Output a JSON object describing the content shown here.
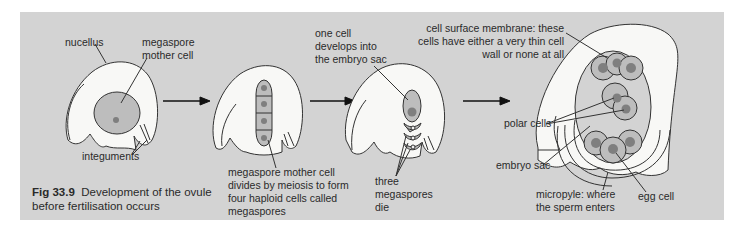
{
  "figure": {
    "number": "Fig 33.9",
    "title_line1": "Development of the ovule",
    "title_line2": "before fertilisation occurs"
  },
  "colors": {
    "background": "#d3d3d3",
    "tissue": "#f8f8f6",
    "cell_fill": "#bdbdbd",
    "nucleus": "#7f7f7f",
    "outline": "#333333"
  },
  "stages": [
    {
      "id": "stage-1",
      "labels": {
        "nucellus": "nucellus",
        "megaspore_l1": "megaspore",
        "megaspore_l2": "mother cell",
        "integuments": "integuments"
      }
    },
    {
      "id": "stage-2",
      "labels": {
        "line1": "megaspore mother cell",
        "line2": "divides by meiosis to form",
        "line3": "four haploid cells called",
        "line4": "megaspores"
      }
    },
    {
      "id": "stage-3",
      "labels": {
        "embryo_l1": "one cell",
        "embryo_l2": "develops into",
        "embryo_l3": "the embryo sac",
        "die_l1": "three",
        "die_l2": "megaspores",
        "die_l3": "die"
      }
    },
    {
      "id": "stage-4",
      "labels": {
        "membrane_l1": "cell surface membrane: these",
        "membrane_l2": "cells have either a very thin cell",
        "membrane_l3": "wall or none at all",
        "polar": "polar cells",
        "embryo_sac": "embryo sac",
        "micropyle_l1": "micropyle: where",
        "micropyle_l2": "the sperm enters",
        "egg": "egg cell"
      }
    }
  ],
  "arrows": [
    "stage-1 to stage-2",
    "stage-2 to stage-3",
    "stage-3 to stage-4"
  ]
}
